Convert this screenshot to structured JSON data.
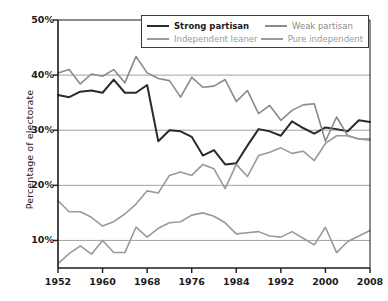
{
  "chart_data": {
    "type": "line",
    "title": "",
    "xlabel": "",
    "ylabel": "Percentage of electorate",
    "xlim": [
      1952,
      2008
    ],
    "ylim": [
      5,
      50
    ],
    "grid": "horizontal",
    "legend_position": "top-center-inside",
    "x": [
      1952,
      1954,
      1956,
      1958,
      1960,
      1962,
      1964,
      1966,
      1968,
      1970,
      1972,
      1974,
      1976,
      1978,
      1980,
      1982,
      1984,
      1986,
      1988,
      1990,
      1992,
      1994,
      1996,
      1998,
      2000,
      2002,
      2004,
      2006,
      2008
    ],
    "xticks": [
      1952,
      1960,
      1968,
      1976,
      1984,
      1992,
      2000,
      2008
    ],
    "xtick_labels": [
      "1952",
      "1960",
      "1968",
      "1976",
      "1984",
      "1992",
      "2000",
      "2008"
    ],
    "yticks": [
      10,
      20,
      30,
      40,
      50
    ],
    "ytick_labels": [
      "10%",
      "20%",
      "30%",
      "40%",
      "50%"
    ],
    "series": [
      {
        "name": "Strong partisan",
        "color": "#2b2b2b",
        "width": 2.0,
        "values": [
          36.4,
          36.0,
          37.0,
          37.2,
          36.8,
          39.2,
          36.8,
          36.8,
          38.2,
          28.0,
          30.0,
          29.8,
          28.8,
          25.4,
          26.4,
          23.8,
          24.0,
          27.2,
          30.2,
          29.8,
          29.0,
          31.6,
          30.4,
          29.4,
          30.5,
          30.2,
          29.8,
          31.8,
          31.5
        ]
      },
      {
        "name": "Weak partisan",
        "color": "#8a8a8a",
        "width": 1.6,
        "values": [
          40.4,
          41.0,
          38.4,
          40.2,
          39.8,
          41.0,
          38.6,
          43.4,
          40.4,
          39.4,
          39.0,
          36.0,
          39.6,
          37.8,
          38.0,
          39.2,
          35.2,
          37.2,
          33.0,
          34.5,
          31.8,
          33.6,
          34.6,
          34.8,
          28.0,
          32.4,
          29.0,
          28.4,
          28.4
        ]
      },
      {
        "name": "Independent leaner",
        "color": "#9a9a9a",
        "width": 1.6,
        "values": [
          17.2,
          15.2,
          15.2,
          14.2,
          12.6,
          13.4,
          14.8,
          16.6,
          19.0,
          18.6,
          21.8,
          22.4,
          21.8,
          23.8,
          23.0,
          19.4,
          23.8,
          21.6,
          25.4,
          26.0,
          26.8,
          25.8,
          26.2,
          24.5,
          27.6,
          29.0,
          29.0,
          28.4,
          28.2
        ]
      },
      {
        "name": "Pure independent",
        "color": "#9a9a9a",
        "width": 1.6,
        "values": [
          5.8,
          7.6,
          9.0,
          7.5,
          10.0,
          7.8,
          7.8,
          12.4,
          10.6,
          12.2,
          13.2,
          13.4,
          14.6,
          15.0,
          14.4,
          13.2,
          11.2,
          11.4,
          11.6,
          10.8,
          10.6,
          11.6,
          10.4,
          9.2,
          12.4,
          7.8,
          9.8,
          10.8,
          11.8
        ]
      }
    ]
  },
  "legend": {
    "items": [
      {
        "label": "Strong partisan",
        "color": "#2b2b2b",
        "bold": true
      },
      {
        "label": "Weak partisan",
        "color": "#8a8a8a",
        "bold": false
      },
      {
        "label": "Independent leaner",
        "color": "#9a9a9a",
        "bold": false
      },
      {
        "label": "Pure independent",
        "color": "#9a9a9a",
        "bold": false
      }
    ]
  },
  "axes": {
    "y_title": "Percentage of electorate"
  }
}
